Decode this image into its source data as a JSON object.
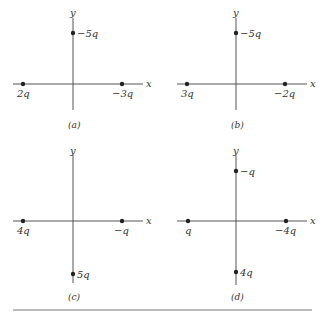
{
  "figure": {
    "panels": [
      {
        "caption": "(a)",
        "axis_x_label": "x",
        "axis_y_label": "y",
        "charges": [
          {
            "label": "2q",
            "position": "left-x-axis"
          },
          {
            "label": "−3q",
            "position": "right-x-axis"
          },
          {
            "label": "−5q",
            "position": "upper-y-axis"
          }
        ]
      },
      {
        "caption": "(b)",
        "axis_x_label": "x",
        "axis_y_label": "y",
        "charges": [
          {
            "label": "3q",
            "position": "left-x-axis"
          },
          {
            "label": "−2q",
            "position": "right-x-axis"
          },
          {
            "label": "−5q",
            "position": "upper-y-axis"
          }
        ]
      },
      {
        "caption": "(c)",
        "axis_x_label": "x",
        "axis_y_label": "y",
        "charges": [
          {
            "label": "4q",
            "position": "left-x-axis"
          },
          {
            "label": "−q",
            "position": "right-x-axis"
          },
          {
            "label": "5q",
            "position": "lower-y-axis"
          }
        ]
      },
      {
        "caption": "(d)",
        "axis_x_label": "x",
        "axis_y_label": "y",
        "charges": [
          {
            "label": "q",
            "position": "left-x-axis"
          },
          {
            "label": "−4q",
            "position": "right-x-axis"
          },
          {
            "label": "−q",
            "position": "upper-y-axis"
          },
          {
            "label": "4q",
            "position": "lower-y-axis"
          }
        ]
      }
    ]
  }
}
